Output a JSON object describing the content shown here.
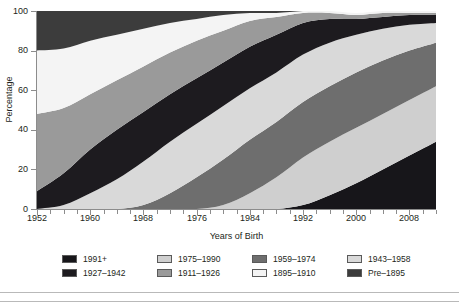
{
  "axes": {
    "y_title": "Percentage",
    "x_title": "Years of Birth",
    "y_ticks": [
      "0",
      "20",
      "40",
      "60",
      "80",
      "100"
    ],
    "x_ticks": [
      "1952",
      "1960",
      "1968",
      "1976",
      "1984",
      "1992",
      "2000",
      "2008"
    ]
  },
  "legend": {
    "items": [
      {
        "label": "1991+",
        "color": "#17161a"
      },
      {
        "label": "1975–1990",
        "color": "#cfcfcf"
      },
      {
        "label": "1959–1974",
        "color": "#6e6e6e"
      },
      {
        "label": "1943–1958",
        "color": "#d9d9d9"
      },
      {
        "label": "1927–1942",
        "color": "#1d1b1f"
      },
      {
        "label": "1911–1926",
        "color": "#9a9a9a"
      },
      {
        "label": "1895–1910",
        "color": "#f4f4f4"
      },
      {
        "label": "Pre–1895",
        "color": "#3c3c3c"
      }
    ]
  },
  "chart_data": {
    "type": "area",
    "title": "",
    "subtitle": "",
    "xlabel": "Years of Birth",
    "ylabel": "Percentage",
    "xlim": [
      1952,
      2012
    ],
    "ylim": [
      0,
      100
    ],
    "stacked": true,
    "normalized_percent": true,
    "grid": false,
    "legend_position": "bottom",
    "x": [
      1952,
      1956,
      1960,
      1964,
      1968,
      1972,
      1976,
      1980,
      1984,
      1988,
      1992,
      1996,
      2000,
      2004,
      2008,
      2012
    ],
    "stack_order_bottom_to_top": [
      "1991+",
      "1975–1990",
      "1959–1974",
      "1943–1958",
      "1927–1942",
      "1911–1926",
      "1895–1910",
      "Pre–1895"
    ],
    "series": [
      {
        "name": "1991+",
        "color": "#17161a",
        "values": [
          0,
          0,
          0,
          0,
          0,
          0,
          0,
          0,
          0,
          0,
          2,
          7,
          13,
          20,
          27,
          34
        ]
      },
      {
        "name": "1975–1990",
        "color": "#cfcfcf",
        "values": [
          0,
          0,
          0,
          0,
          0,
          0,
          0,
          2,
          8,
          16,
          24,
          27,
          28,
          28,
          28,
          28
        ]
      },
      {
        "name": "1959–1974",
        "color": "#6e6e6e",
        "values": [
          0,
          0,
          0,
          0,
          2,
          8,
          16,
          23,
          27,
          28,
          28,
          28,
          28,
          27,
          25,
          22
        ]
      },
      {
        "name": "1943–1958",
        "color": "#d9d9d9",
        "values": [
          0,
          2,
          8,
          15,
          22,
          26,
          27,
          27,
          26,
          25,
          24,
          22,
          19,
          16,
          13,
          10
        ]
      },
      {
        "name": "1927–1942",
        "color": "#1d1b1f",
        "values": [
          9,
          16,
          22,
          25,
          25,
          24,
          23,
          22,
          21,
          19,
          16,
          12,
          8,
          6,
          5,
          4
        ]
      },
      {
        "name": "1911–1926",
        "color": "#9a9a9a",
        "values": [
          39,
          33,
          28,
          25,
          23,
          21,
          19,
          16,
          13,
          9,
          5,
          3,
          2,
          2,
          1,
          1
        ]
      },
      {
        "name": "1895–1910",
        "color": "#f4f4f4",
        "values": [
          32,
          30,
          27,
          23,
          19,
          15,
          11,
          8,
          4,
          2,
          1,
          1,
          1,
          1,
          1,
          1
        ]
      },
      {
        "name": "Pre–1895",
        "color": "#3c3c3c",
        "values": [
          20,
          19,
          15,
          12,
          9,
          6,
          4,
          2,
          1,
          1,
          0,
          0,
          0,
          0,
          0,
          0
        ]
      }
    ]
  }
}
